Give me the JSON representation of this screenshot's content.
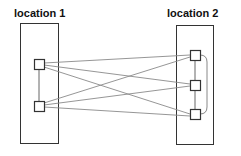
{
  "diagram": {
    "locations": [
      {
        "id": "loc1",
        "label": "location 1",
        "nodes": 2
      },
      {
        "id": "loc2",
        "label": "location 2",
        "nodes": 3
      }
    ],
    "edges": [
      {
        "from": "loc1.n1",
        "to": "loc2.n1"
      },
      {
        "from": "loc1.n1",
        "to": "loc2.n2"
      },
      {
        "from": "loc1.n1",
        "to": "loc2.n3"
      },
      {
        "from": "loc1.n2",
        "to": "loc2.n1"
      },
      {
        "from": "loc1.n2",
        "to": "loc2.n2"
      },
      {
        "from": "loc1.n2",
        "to": "loc2.n3"
      },
      {
        "from": "loc1.n1",
        "to": "loc1.n2"
      },
      {
        "from": "loc2.n1",
        "to": "loc2.n2"
      },
      {
        "from": "loc2.n2",
        "to": "loc2.n3"
      },
      {
        "from": "loc2.n1",
        "to": "loc2.n3",
        "style": "curved"
      }
    ],
    "colors": {
      "box": "#333333",
      "node": "#333333",
      "line": "#888888"
    }
  }
}
